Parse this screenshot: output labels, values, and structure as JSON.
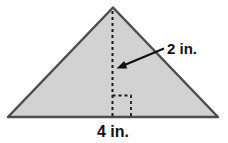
{
  "figure": {
    "type": "geometry-diagram",
    "shape": "triangle",
    "labels": {
      "height": "2 in.",
      "base": "4 in."
    },
    "values": {
      "height_inches": 2,
      "base_inches": 4
    }
  },
  "colors": {
    "background": "#ffffff",
    "triangle_fill": "#d2d2d2",
    "triangle_stroke": "#4d4d4d",
    "dashed_line": "#1a1a1a",
    "arrow": "#111111",
    "text": "#111111"
  }
}
